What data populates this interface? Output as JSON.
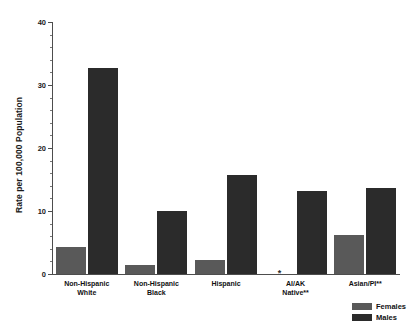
{
  "chart_data": {
    "type": "bar",
    "title": "",
    "xlabel": "",
    "ylabel": "Rate per 100,000 Population",
    "ylim": [
      0,
      40
    ],
    "ytick_labels": [
      "0",
      "10",
      "20",
      "30",
      "40"
    ],
    "ytick_values": [
      0,
      10,
      20,
      30,
      40
    ],
    "grid": false,
    "legend_position": "bottom-right",
    "categories": [
      "Non-Hispanic\nWhite",
      "Non-Hispanic\nBlack",
      "Hispanic",
      "AI/AK\nNative**",
      "Asian/PI**"
    ],
    "category_lines": [
      [
        "Non-Hispanic",
        "White"
      ],
      [
        "Non-Hispanic",
        "Black"
      ],
      [
        "Hispanic",
        ""
      ],
      [
        "AI/AK",
        "Native**"
      ],
      [
        "Asian/PI**",
        ""
      ]
    ],
    "series": [
      {
        "name": "Females",
        "color": "#595959",
        "values": [
          4.3,
          1.5,
          2.2,
          null,
          6.2
        ],
        "suppressed_marker": "*"
      },
      {
        "name": "Males",
        "color": "#2b2b2b",
        "values": [
          32.7,
          10.0,
          15.7,
          13.2,
          13.6
        ]
      }
    ]
  },
  "legend": {
    "items": [
      {
        "label": "Females",
        "color": "#595959"
      },
      {
        "label": "Males",
        "color": "#2b2b2b"
      }
    ]
  }
}
